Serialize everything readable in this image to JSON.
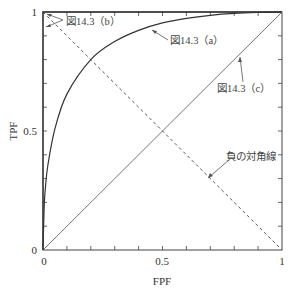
{
  "chart_data": {
    "type": "line",
    "title": "",
    "xlabel": "FPF",
    "ylabel": "TPF",
    "xlim": [
      0,
      1
    ],
    "ylim": [
      0,
      1
    ],
    "xticks": [
      "0",
      "0.5",
      "1"
    ],
    "yticks": [
      "0",
      "0.5",
      "1"
    ],
    "minor_tick_step": 0.1,
    "grid": false,
    "legend": null,
    "series": [
      {
        "name": "図14.3 (a)",
        "style": "solid",
        "x": [
          0,
          0.005,
          0.01,
          0.02,
          0.05,
          0.1,
          0.2,
          0.3,
          0.4,
          0.5,
          0.6,
          0.7,
          0.8,
          0.9,
          1.0
        ],
        "y": [
          0,
          0.185,
          0.26,
          0.354,
          0.51,
          0.655,
          0.8,
          0.876,
          0.923,
          0.954,
          0.973,
          0.986,
          0.994,
          0.998,
          1.0
        ]
      },
      {
        "name": "図14.3 (b)",
        "style": "solid",
        "x": [
          0,
          0,
          1
        ],
        "y": [
          0,
          1,
          1
        ]
      },
      {
        "name": "図14.3 (c)",
        "style": "solid",
        "x": [
          0,
          1
        ],
        "y": [
          0,
          1
        ]
      },
      {
        "name": "負の対角線",
        "style": "dashed",
        "x": [
          0,
          1
        ],
        "y": [
          1,
          0
        ]
      }
    ],
    "annotations": [
      {
        "text": "図14.3（b）",
        "points_to": [
          [
            0,
            1
          ],
          [
            0.005,
            1
          ],
          [
            0,
            0.97
          ]
        ]
      },
      {
        "text": "図14.3（a）",
        "points_to": [
          [
            0.48,
            0.955
          ]
        ]
      },
      {
        "text": "図14.3（c）",
        "points_to": [
          [
            0.76,
            0.76
          ]
        ]
      },
      {
        "text": "負の対角線",
        "points_to": [
          [
            0.68,
            0.32
          ]
        ]
      }
    ]
  },
  "labels": {
    "xlabel": "FPF",
    "ylabel": "TPF",
    "x0": "0",
    "x05": "0.5",
    "x1": "1",
    "y0": "0",
    "y05": "0.5",
    "y1": "1",
    "ann_a": "図14.3（a）",
    "ann_b": "図14.3（b）",
    "ann_c": "図14.3（c）",
    "ann_neg": "負の対角線"
  }
}
